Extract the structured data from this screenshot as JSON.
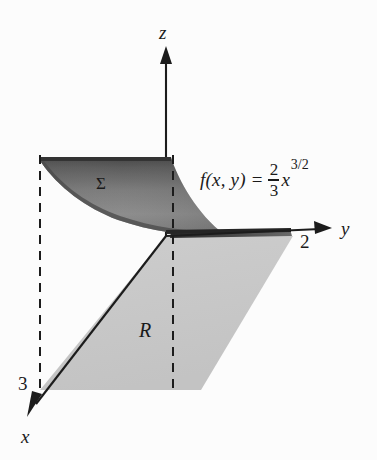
{
  "figure": {
    "kind": "3d-surface-over-region-diagram",
    "background_color": "#fcfcfc",
    "axes": [
      {
        "name": "z",
        "label": "z",
        "direction": "vertical-up"
      },
      {
        "name": "y",
        "label": "y",
        "direction": "horizontal-right"
      },
      {
        "name": "x",
        "label": "x",
        "direction": "diagonal-down-left"
      }
    ],
    "axis_labels": {
      "z": "z",
      "y": "y",
      "x": "x"
    },
    "tick_labels": {
      "y_tick": "2",
      "x_tick": "3"
    },
    "surface": {
      "label": "Σ",
      "fill_dark": "#4f4f4f",
      "fill_light": "#9a9a9a"
    },
    "region": {
      "label": "R",
      "fill": "#c9c9c9",
      "shape": "parallelogram"
    },
    "equation": {
      "lhs": "f(x, y)",
      "equals": "=",
      "numerator": "2",
      "denominator": "3",
      "variable": "x",
      "exponent": "3/2",
      "plain": "f(x, y) = (2/3)x^(3/2)"
    }
  }
}
